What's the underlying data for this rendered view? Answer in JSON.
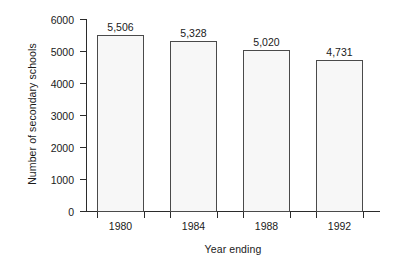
{
  "chart_data": {
    "type": "bar",
    "title": "",
    "subtitle": "",
    "xlabel": "Year ending",
    "ylabel": "Number of secondary schools",
    "categories": [
      "1980",
      "1984",
      "1988",
      "1992"
    ],
    "values": [
      5506,
      5328,
      5020,
      4731
    ],
    "value_labels": [
      "5,506",
      "5,328",
      "5,020",
      "4,731"
    ],
    "series": [
      {
        "name": "Number of secondary schools",
        "values": [
          5506,
          5328,
          5020,
          4731
        ]
      }
    ],
    "ylim": [
      0,
      6000
    ],
    "ytick_values": [
      0,
      1000,
      2000,
      3000,
      4000,
      5000,
      6000
    ],
    "ytick_labels": [
      "0",
      "1000",
      "2000",
      "3000",
      "4000",
      "5000",
      "6000"
    ],
    "grid": false,
    "legend": false,
    "legend_position": "none",
    "bar_fill_color": "#f7f7f7",
    "bar_border_color": "#4a4a4a",
    "axis_color": "#2b2b2b",
    "background_color": "#ffffff",
    "text_color": "#1a1a1a"
  }
}
